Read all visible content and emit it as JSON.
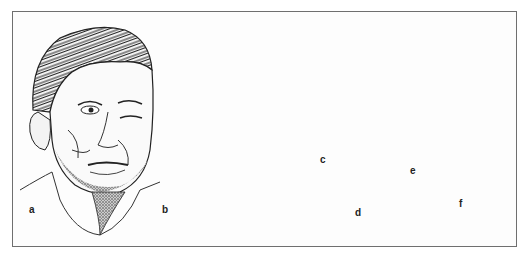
{
  "figure": {
    "panels": [
      {
        "id": "a",
        "label": "a",
        "subject": "frontal face of man with facial lesions"
      },
      {
        "id": "b",
        "label": "b",
        "subject": "back of head and neck"
      },
      {
        "id": "c",
        "label": "c",
        "subject": "round amastigote form with nucleus and kinetoplast"
      },
      {
        "id": "d",
        "label": "d",
        "subject": "elongated promastigote form with anterior flagellum"
      },
      {
        "id": "e",
        "label": "e",
        "subject": "irregular flagellate form"
      },
      {
        "id": "f",
        "label": "f",
        "subject": "trypomastigote form with undulating membrane"
      }
    ]
  }
}
